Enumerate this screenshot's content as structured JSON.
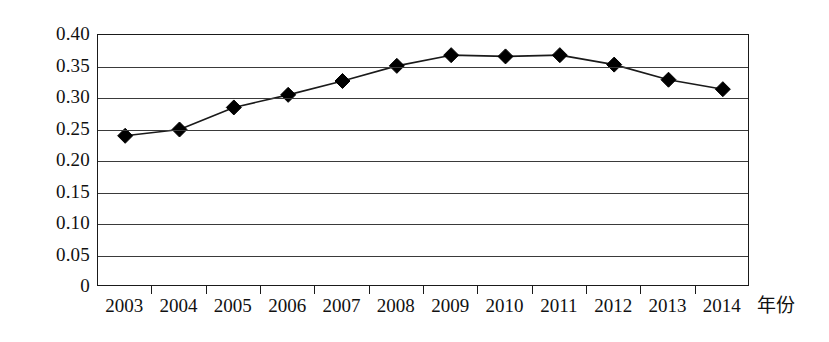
{
  "chart_data": {
    "type": "line",
    "title": "",
    "subtitle": "",
    "xlabel": "年份",
    "ylabel": "",
    "categories": [
      "2003",
      "2004",
      "2005",
      "2006",
      "2007",
      "2008",
      "2009",
      "2010",
      "2011",
      "2012",
      "2013",
      "2014"
    ],
    "values": [
      0.24,
      0.25,
      0.285,
      0.305,
      0.327,
      0.351,
      0.368,
      0.366,
      0.368,
      0.353,
      0.329,
      0.314
    ],
    "series": [
      {
        "name": "",
        "values": [
          0.24,
          0.25,
          0.285,
          0.305,
          0.327,
          0.351,
          0.368,
          0.366,
          0.368,
          0.353,
          0.329,
          0.314
        ]
      }
    ],
    "ylim": [
      0,
      0.4
    ],
    "yticks": [
      0,
      0.05,
      0.1,
      0.15,
      0.2,
      0.25,
      0.3,
      0.35,
      0.4
    ],
    "ytick_labels": [
      "0",
      "0.05",
      "0.10",
      "0.15",
      "0.20",
      "0.25",
      "0.30",
      "0.35",
      "0.40"
    ],
    "grid": true,
    "grid_axis": "y",
    "legend": false,
    "legend_position": "none",
    "marker": "diamond",
    "line_color": "#1a1a1a",
    "marker_color": "#000000",
    "plot_background": "#ffffff",
    "annotations": []
  }
}
